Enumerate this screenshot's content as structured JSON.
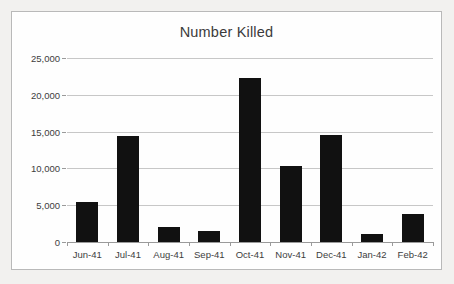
{
  "chart_data": {
    "type": "bar",
    "title": "Number Killed",
    "xlabel": "",
    "ylabel": "",
    "categories": [
      "Jun-41",
      "Jul-41",
      "Aug-41",
      "Sep-41",
      "Oct-41",
      "Nov-41",
      "Dec-41",
      "Jan-42",
      "Feb-42"
    ],
    "values": [
      5400,
      14400,
      2100,
      1500,
      22300,
      10300,
      14600,
      1150,
      3800
    ],
    "ylim": [
      0,
      25000
    ],
    "ytick_values": [
      0,
      5000,
      10000,
      15000,
      20000,
      25000
    ],
    "ytick_labels": [
      "0",
      "5,000",
      "10,000",
      "15,000",
      "20,000",
      "25,000"
    ],
    "grid": true,
    "legend": null,
    "bar_color": "#111111",
    "gridline_color": "#c7c7c7",
    "axis_color": "#9a9a9a",
    "text_color": "#3d3d3d"
  }
}
